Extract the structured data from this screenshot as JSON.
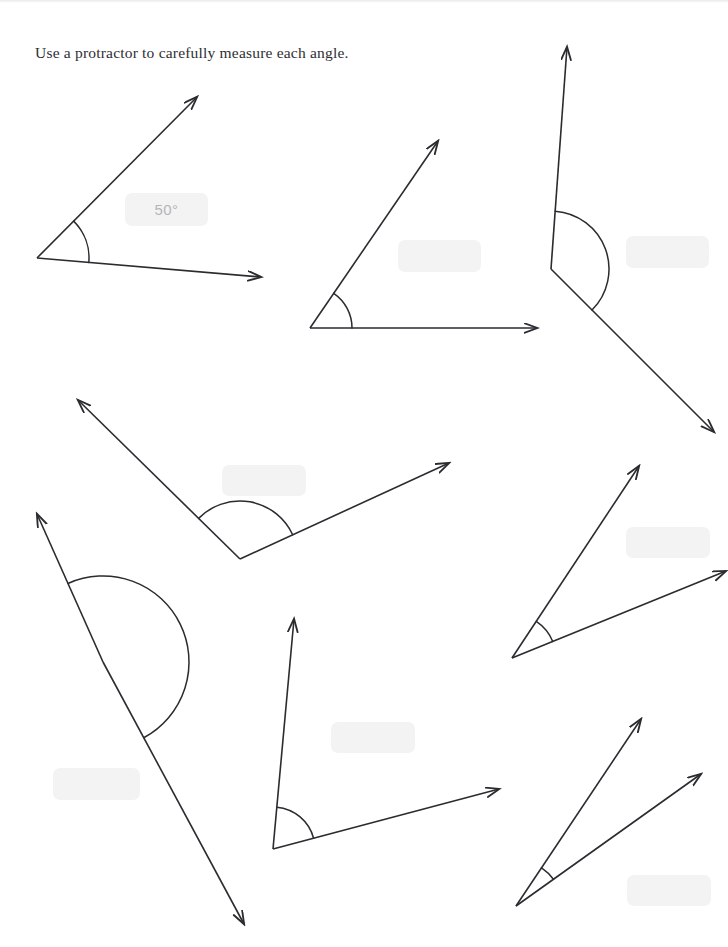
{
  "page": {
    "background_color": "#ffffff",
    "width": 728,
    "height": 947
  },
  "instruction": {
    "text": "Use a protractor to carefully measure each angle."
  },
  "style": {
    "stroke_color": "#2b2b30",
    "stroke_width": 1.6,
    "arc_stroke_width": 1.5,
    "answer_box_fill": "#f3f3f4",
    "answer_text_color": "#b5b5b8"
  },
  "angles": [
    {
      "id": "angle-1",
      "position": "top-left",
      "answer": "50°",
      "vertex": [
        37,
        258
      ],
      "ray_a_end": [
        197,
        97
      ],
      "ray_b_end": [
        261,
        277
      ],
      "arc_radius": 52,
      "answer_box": {
        "x": 125,
        "y": 193,
        "w": 83,
        "h": 33
      }
    },
    {
      "id": "angle-2",
      "position": "top-middle",
      "answer": "",
      "vertex": [
        310,
        328
      ],
      "ray_a_end": [
        438,
        141
      ],
      "ray_b_end": [
        537,
        328
      ],
      "arc_radius": 42,
      "answer_box": {
        "x": 398,
        "y": 240,
        "w": 83,
        "h": 32
      }
    },
    {
      "id": "angle-3",
      "position": "top-right",
      "answer": "",
      "vertex": [
        551,
        269
      ],
      "ray_a_end": [
        567,
        47
      ],
      "ray_b_end": [
        714,
        432
      ],
      "arc_radius": 58,
      "answer_box": {
        "x": 626,
        "y": 236,
        "w": 83,
        "h": 32
      }
    },
    {
      "id": "angle-4",
      "position": "middle-left",
      "answer": "",
      "vertex": [
        240,
        559
      ],
      "ray_a_end": [
        78,
        400
      ],
      "ray_b_end": [
        449,
        463
      ],
      "arc_radius": 58,
      "answer_box": {
        "x": 222,
        "y": 465,
        "w": 84,
        "h": 31
      }
    },
    {
      "id": "angle-5",
      "position": "bottom-left",
      "answer": "",
      "vertex": [
        103,
        662
      ],
      "ray_a_end": [
        37,
        514
      ],
      "ray_b_end": [
        244,
        924
      ],
      "arc_radius": 86,
      "answer_box": {
        "x": 53,
        "y": 768,
        "w": 87,
        "h": 32
      }
    },
    {
      "id": "angle-6",
      "position": "bottom-middle",
      "answer": "",
      "vertex": [
        273,
        849
      ],
      "ray_a_end": [
        294,
        619
      ],
      "ray_b_end": [
        499,
        789
      ],
      "arc_radius": 42,
      "answer_box": {
        "x": 331,
        "y": 722,
        "w": 84,
        "h": 31
      }
    },
    {
      "id": "angle-7",
      "position": "middle-right",
      "answer": "",
      "vertex": [
        512,
        658
      ],
      "ray_a_end": [
        639,
        466
      ],
      "ray_b_end": [
        726,
        571
      ],
      "arc_radius": 44,
      "answer_box": {
        "x": 626,
        "y": 527,
        "w": 84,
        "h": 31
      }
    },
    {
      "id": "angle-8",
      "position": "bottom-right",
      "answer": "",
      "vertex": [
        516,
        906
      ],
      "ray_a_end": [
        641,
        719
      ],
      "ray_b_end": [
        701,
        774
      ],
      "arc_radius": 46,
      "answer_box": {
        "x": 627,
        "y": 875,
        "w": 84,
        "h": 31
      }
    }
  ]
}
